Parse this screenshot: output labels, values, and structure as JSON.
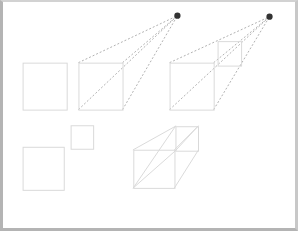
{
  "canvas": {
    "width": 298,
    "height": 231,
    "background_color": "#ffffff",
    "frame_color": "#b4b4b4",
    "title": "One-point perspective construction diagram"
  },
  "style": {
    "solid_stroke_color": "#d9d9d9",
    "solid_stroke_width": 1,
    "dashed_stroke_color": "#8c8c8c",
    "dashed_stroke_width": 0.7,
    "dash_pattern": "2,2",
    "vanishing_point_color": "#333333",
    "vanishing_point_radius": 3.2
  },
  "shapes": {
    "plain_square": {
      "name": "plain-square",
      "x": 20,
      "y": 62,
      "width": 45,
      "height": 48
    },
    "construction_one_square": {
      "name": "construction-one-front-square",
      "x": 77,
      "y": 62,
      "width": 45,
      "height": 48
    },
    "construction_two_square": {
      "name": "construction-two-front-square",
      "x": 170,
      "y": 62,
      "width": 45,
      "height": 48
    },
    "construction_two_back_square": {
      "name": "construction-two-back-square",
      "x": 219,
      "y": 40,
      "width": 24,
      "height": 25
    },
    "small_square": {
      "name": "small-square",
      "x": 69,
      "y": 126,
      "width": 23,
      "height": 24
    },
    "lower_square": {
      "name": "lower-square",
      "x": 20,
      "y": 148,
      "width": 42,
      "height": 44
    }
  },
  "vanishing_points": [
    {
      "label": "vanishing-point-1",
      "cx": 178,
      "cy": 14
    },
    {
      "label": "vanishing-point-2",
      "cx": 272,
      "cy": 15
    }
  ],
  "guide_lines": {
    "construction_one": [
      {
        "x1": 77,
        "y1": 62,
        "x2": 178,
        "y2": 14
      },
      {
        "x1": 122,
        "y1": 62,
        "x2": 178,
        "y2": 14
      },
      {
        "x1": 77,
        "y1": 110,
        "x2": 178,
        "y2": 14
      },
      {
        "x1": 122,
        "y1": 110,
        "x2": 178,
        "y2": 14
      }
    ],
    "construction_two": [
      {
        "x1": 170,
        "y1": 62,
        "x2": 272,
        "y2": 15
      },
      {
        "x1": 215,
        "y1": 62,
        "x2": 272,
        "y2": 15
      },
      {
        "x1": 170,
        "y1": 110,
        "x2": 272,
        "y2": 15
      },
      {
        "x1": 215,
        "y1": 110,
        "x2": 272,
        "y2": 15
      }
    ]
  },
  "solid_box": {
    "name": "finished-perspective-box",
    "front_face": {
      "x": 133,
      "y": 151,
      "width": 42,
      "height": 39
    },
    "back_face": {
      "x": 176,
      "y": 127,
      "width": 23,
      "height": 25
    },
    "connector_edges": [
      {
        "x1": 133,
        "y1": 151,
        "x2": 176,
        "y2": 127
      },
      {
        "x1": 175,
        "y1": 151,
        "x2": 199,
        "y2": 127
      },
      {
        "x1": 133,
        "y1": 190,
        "x2": 176,
        "y2": 152
      },
      {
        "x1": 175,
        "y1": 190,
        "x2": 199,
        "y2": 152
      }
    ],
    "diagonals": [
      {
        "x1": 133,
        "y1": 190,
        "x2": 176,
        "y2": 127
      },
      {
        "x1": 176,
        "y1": 152,
        "x2": 199,
        "y2": 127
      }
    ]
  }
}
